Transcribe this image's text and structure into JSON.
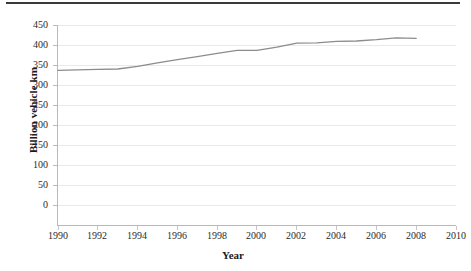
{
  "chart_data": {
    "type": "line",
    "title": "",
    "xlabel": "Year",
    "ylabel": "Billion vehicle km",
    "xlim": [
      1990,
      2010
    ],
    "ylim": [
      0,
      450
    ],
    "xticks": [
      1990,
      1992,
      1994,
      1996,
      1998,
      2000,
      2002,
      2004,
      2006,
      2008,
      2010
    ],
    "yticks": [
      0,
      50,
      100,
      150,
      200,
      250,
      300,
      350,
      400,
      450
    ],
    "grid": "horizontal",
    "legend": "none",
    "line_color": "#8c8c8c",
    "series": [
      {
        "name": "Road traffic",
        "x": [
          1990,
          1991,
          1992,
          1993,
          1994,
          1995,
          1996,
          1997,
          1998,
          1999,
          2000,
          2001,
          2002,
          2003,
          2004,
          2005,
          2006,
          2007,
          2008
        ],
        "values": [
          348,
          349,
          350,
          351,
          357,
          365,
          372,
          379,
          386,
          393,
          393,
          400,
          409,
          410,
          413,
          414,
          417,
          421,
          420
        ]
      }
    ]
  },
  "axes": {
    "y_title": "Billion vehicle km",
    "x_title": "Year",
    "y_tick_labels": [
      "450",
      "400",
      "350",
      "300",
      "250",
      "200",
      "150",
      "100",
      "50",
      "0"
    ],
    "x_tick_labels": [
      "1990",
      "1992",
      "1994",
      "1996",
      "1998",
      "2000",
      "2002",
      "2004",
      "2006",
      "2008",
      "2010"
    ]
  },
  "colors": {
    "line": "#8c8c8c",
    "grid": "#e9e9ec",
    "axis": "#b9b9bd",
    "text": "#2b2b2b",
    "top_rule": "#3a3a3a"
  }
}
